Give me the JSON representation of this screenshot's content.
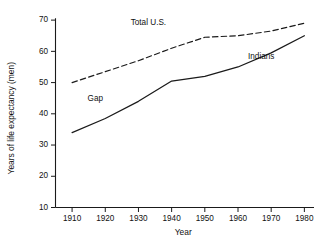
{
  "chart_data": {
    "type": "line",
    "title": "",
    "xlabel": "Year",
    "ylabel": "Years of life expectancy (men)",
    "xlim": [
      1905,
      1982
    ],
    "ylim": [
      10,
      71
    ],
    "xticks": [
      1910,
      1920,
      1930,
      1940,
      1950,
      1960,
      1970,
      1980
    ],
    "xtick_labels": [
      "1910",
      "1920",
      "1930",
      "1940",
      "1950",
      "1960",
      "1970",
      "1980"
    ],
    "yticks": [
      10,
      20,
      30,
      40,
      50,
      60,
      70
    ],
    "ytick_labels": [
      "10",
      "20",
      "30",
      "40",
      "50",
      "60",
      "70"
    ],
    "grid": false,
    "legend_position": "inline-annotations",
    "x": [
      1910,
      1920,
      1930,
      1940,
      1950,
      1960,
      1970,
      1980
    ],
    "series": [
      {
        "name": "Total U.S.",
        "style": "dashed",
        "color": "#1a1a1a",
        "values": [
          50.0,
          53.5,
          57.0,
          61.0,
          64.5,
          65.0,
          66.5,
          69.0
        ],
        "label_x": 1933,
        "label_y": 68.5
      },
      {
        "name": "Indians",
        "style": "solid",
        "color": "#1a1a1a",
        "values": [
          34.0,
          38.5,
          44.0,
          50.5,
          52.0,
          55.0,
          59.5,
          65.0
        ],
        "label_x": 1967,
        "label_y": 57.5
      }
    ],
    "annotations": [
      {
        "text": "Gap",
        "x": 1917,
        "y": 44.0
      }
    ]
  },
  "colors": {
    "background": "#ffffff",
    "ink": "#1a1a1a",
    "text": "#111111"
  }
}
